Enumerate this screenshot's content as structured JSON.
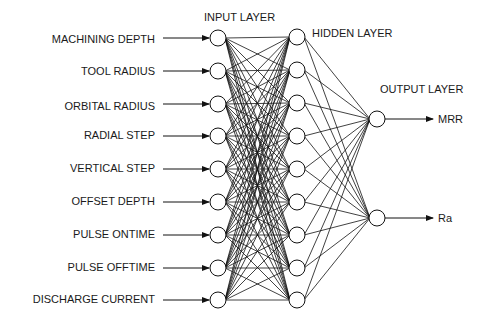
{
  "layers": {
    "input_title": "INPUT LAYER",
    "hidden_title": "HIDDEN LAYER",
    "output_title": "OUTPUT LAYER"
  },
  "inputs": [
    {
      "label": "MACHINING DEPTH",
      "y": 38
    },
    {
      "label": "TOOL RADIUS",
      "y": 71
    },
    {
      "label": "ORBITAL RADIUS",
      "y": 104
    },
    {
      "label": "RADIAL STEP",
      "y": 136
    },
    {
      "label": "VERTICAL STEP",
      "y": 169
    },
    {
      "label": "OFFSET DEPTH",
      "y": 202
    },
    {
      "label": "PULSE ONTIME",
      "y": 235
    },
    {
      "label": "PULSE OFFTIME",
      "y": 268
    },
    {
      "label": "DISCHARGE CURRENT",
      "y": 300
    }
  ],
  "hidden_count": 9,
  "outputs": [
    {
      "label": "MRR",
      "y": 119
    },
    {
      "label": "Ra",
      "y": 218
    }
  ],
  "geometry": {
    "input_x": 218,
    "hidden_x": 297,
    "output_x": 377,
    "node_r": 8,
    "hidden_ys": [
      37,
      70,
      103,
      136,
      169,
      202,
      235,
      268,
      300
    ]
  },
  "colors": {
    "stroke": "#111111",
    "text": "#1a1a1a"
  }
}
